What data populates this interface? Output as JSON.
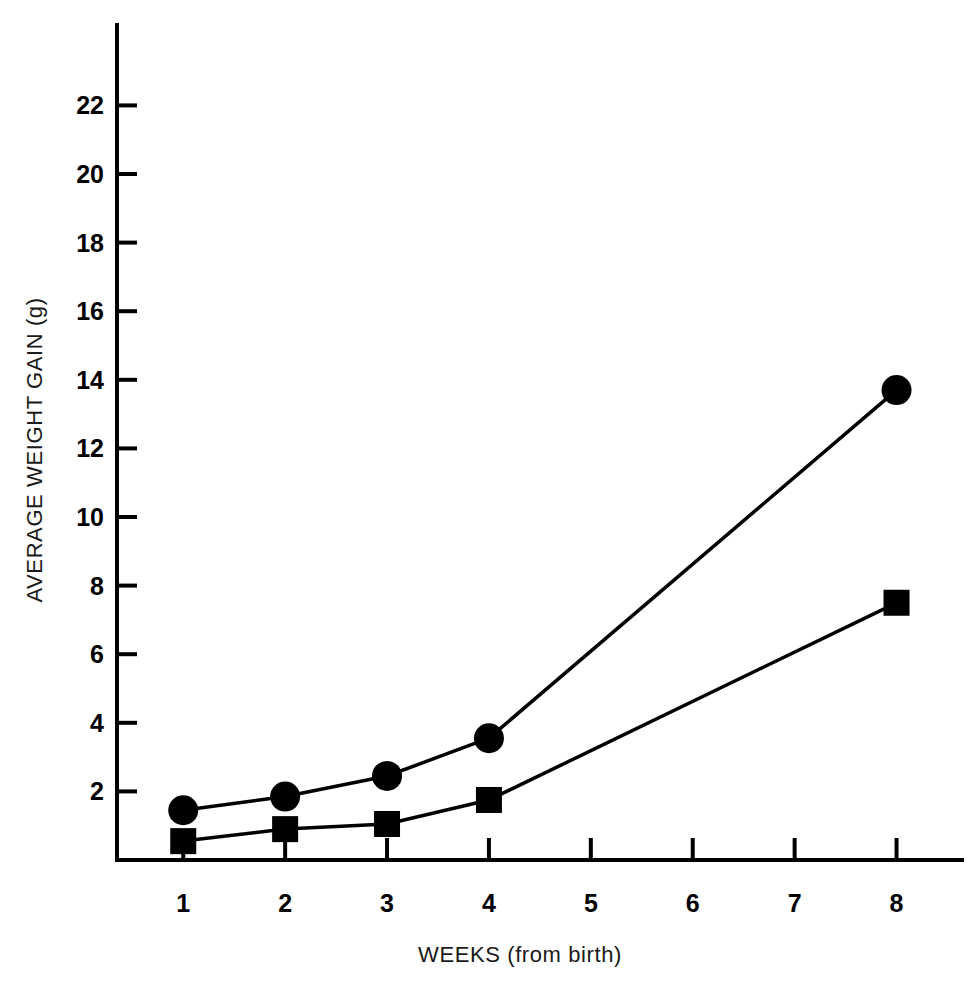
{
  "chart_data": {
    "type": "line",
    "title": "",
    "xlabel": "WEEKS (from birth)",
    "ylabel": "AVERAGE WEIGHT GAIN (g)",
    "x": [
      1,
      2,
      3,
      4,
      8
    ],
    "x_tick_labels": [
      "1",
      "2",
      "3",
      "4",
      "5",
      "6",
      "7",
      "8"
    ],
    "x_tick_values": [
      1,
      2,
      3,
      4,
      5,
      6,
      7,
      8
    ],
    "xlim": [
      0.35,
      8.75
    ],
    "y_tick_labels": [
      "2",
      "4",
      "6",
      "8",
      "10",
      "12",
      "14",
      "16",
      "18",
      "20",
      "22"
    ],
    "y_tick_values": [
      2,
      4,
      6,
      8,
      10,
      12,
      14,
      16,
      18,
      20,
      22
    ],
    "ylim": [
      0,
      23.8
    ],
    "grid": false,
    "legend": "none",
    "series": [
      {
        "name": "circle-series",
        "marker": "circle",
        "color": "#000000",
        "x": [
          1,
          2,
          3,
          4,
          8
        ],
        "values": [
          1.45,
          1.85,
          2.45,
          3.55,
          13.7
        ]
      },
      {
        "name": "square-series",
        "marker": "square",
        "color": "#000000",
        "x": [
          1,
          2,
          3,
          4,
          8
        ],
        "values": [
          0.55,
          0.9,
          1.05,
          1.75,
          7.5
        ]
      }
    ]
  }
}
